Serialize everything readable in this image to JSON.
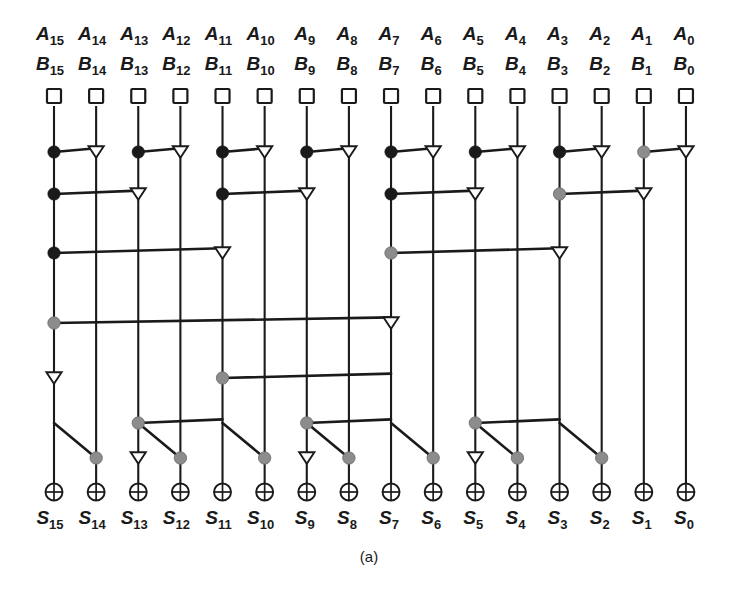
{
  "figure": {
    "caption": "(a)",
    "columns": 16,
    "bit_indices": [
      15,
      14,
      13,
      12,
      11,
      10,
      9,
      8,
      7,
      6,
      5,
      4,
      3,
      2,
      1,
      0
    ],
    "input_labels_a": [
      "A15",
      "A14",
      "A13",
      "A12",
      "A11",
      "A10",
      "A9",
      "A8",
      "A7",
      "A6",
      "A5",
      "A4",
      "A3",
      "A2",
      "A1",
      "A0"
    ],
    "input_labels_b": [
      "B15",
      "B14",
      "B13",
      "B12",
      "B11",
      "B10",
      "B9",
      "B8",
      "B7",
      "B6",
      "B5",
      "B4",
      "B3",
      "B2",
      "B1",
      "B0"
    ],
    "output_labels_s": [
      "S15",
      "S14",
      "S13",
      "S12",
      "S11",
      "S10",
      "S9",
      "S8",
      "S7",
      "S6",
      "S5",
      "S4",
      "S3",
      "S2",
      "S1",
      "S0"
    ],
    "label_letter_a": "A",
    "label_letter_b": "B",
    "label_letter_s": "S",
    "colors": {
      "line": "#1a1a1a",
      "black_cell": "#1a1a1a",
      "gray_cell": "#8c8c8c",
      "buffer_fill": "#ffffff",
      "background": "#ffffff"
    },
    "node_legend": {
      "square": "pg-generation-cell",
      "black_dot": "black-prefix-cell",
      "gray_dot": "gray-prefix-cell",
      "triangle": "buffer-cell",
      "circle_plus": "xor-sum-cell"
    }
  },
  "geometry": {
    "col_x0": 54.0,
    "col_dx": 42.13,
    "y_label_a": 40,
    "y_label_b": 70,
    "y_square": 97,
    "y_rows": [
      152,
      194,
      253,
      323,
      378,
      423,
      458
    ],
    "y_xor": 492,
    "y_label_s": 524,
    "y_caption": 562,
    "wire_top": 106,
    "wire_bottom": 483
  },
  "network": {
    "rows": [
      {
        "index": 1,
        "y": 152,
        "cells": [
          {
            "bit": 15,
            "type": "black"
          },
          {
            "bit": 14,
            "type": "buffer"
          },
          {
            "bit": 13,
            "type": "black"
          },
          {
            "bit": 12,
            "type": "buffer"
          },
          {
            "bit": 11,
            "type": "black"
          },
          {
            "bit": 10,
            "type": "buffer"
          },
          {
            "bit": 9,
            "type": "black"
          },
          {
            "bit": 8,
            "type": "buffer"
          },
          {
            "bit": 7,
            "type": "black"
          },
          {
            "bit": 6,
            "type": "buffer"
          },
          {
            "bit": 5,
            "type": "black"
          },
          {
            "bit": 4,
            "type": "buffer"
          },
          {
            "bit": 3,
            "type": "black"
          },
          {
            "bit": 2,
            "type": "buffer"
          },
          {
            "bit": 1,
            "type": "gray"
          },
          {
            "bit": 0,
            "type": "buffer"
          }
        ],
        "links": [
          {
            "from_bit": 14,
            "to_bit": 15
          },
          {
            "from_bit": 12,
            "to_bit": 13
          },
          {
            "from_bit": 10,
            "to_bit": 11
          },
          {
            "from_bit": 8,
            "to_bit": 9
          },
          {
            "from_bit": 6,
            "to_bit": 7
          },
          {
            "from_bit": 4,
            "to_bit": 5
          },
          {
            "from_bit": 2,
            "to_bit": 3
          },
          {
            "from_bit": 0,
            "to_bit": 1
          }
        ]
      },
      {
        "index": 2,
        "y": 194,
        "cells": [
          {
            "bit": 15,
            "type": "black"
          },
          {
            "bit": 13,
            "type": "buffer"
          },
          {
            "bit": 11,
            "type": "black"
          },
          {
            "bit": 9,
            "type": "buffer"
          },
          {
            "bit": 7,
            "type": "black"
          },
          {
            "bit": 5,
            "type": "buffer"
          },
          {
            "bit": 3,
            "type": "gray"
          },
          {
            "bit": 1,
            "type": "buffer"
          }
        ],
        "links": [
          {
            "from_bit": 13,
            "to_bit": 15
          },
          {
            "from_bit": 9,
            "to_bit": 11
          },
          {
            "from_bit": 5,
            "to_bit": 7
          },
          {
            "from_bit": 1,
            "to_bit": 3
          }
        ]
      },
      {
        "index": 3,
        "y": 253,
        "cells": [
          {
            "bit": 15,
            "type": "black"
          },
          {
            "bit": 11,
            "type": "buffer"
          },
          {
            "bit": 7,
            "type": "gray"
          },
          {
            "bit": 3,
            "type": "buffer"
          }
        ],
        "links": [
          {
            "from_bit": 11,
            "to_bit": 15
          },
          {
            "from_bit": 3,
            "to_bit": 7
          }
        ]
      },
      {
        "index": 4,
        "y": 323,
        "cells": [
          {
            "bit": 15,
            "type": "gray"
          },
          {
            "bit": 7,
            "type": "buffer"
          }
        ],
        "links": [
          {
            "from_bit": 7,
            "to_bit": 15
          }
        ]
      },
      {
        "index": 5,
        "y": 378,
        "cells": [
          {
            "bit": 15,
            "type": "buffer"
          },
          {
            "bit": 11,
            "type": "gray"
          }
        ],
        "links": [
          {
            "from_bit": 7,
            "to_bit": 11
          }
        ]
      },
      {
        "index": 6,
        "y": 423,
        "cells": [
          {
            "bit": 13,
            "type": "gray"
          },
          {
            "bit": 9,
            "type": "gray"
          },
          {
            "bit": 5,
            "type": "gray"
          }
        ],
        "links": [
          {
            "from_bit": 11,
            "to_bit": 13
          },
          {
            "from_bit": 7,
            "to_bit": 9
          },
          {
            "from_bit": 3,
            "to_bit": 5
          }
        ]
      },
      {
        "index": 7,
        "y": 458,
        "cells": [
          {
            "bit": 14,
            "type": "gray"
          },
          {
            "bit": 13,
            "type": "buffer"
          },
          {
            "bit": 12,
            "type": "gray"
          },
          {
            "bit": 10,
            "type": "gray"
          },
          {
            "bit": 9,
            "type": "buffer"
          },
          {
            "bit": 8,
            "type": "gray"
          },
          {
            "bit": 6,
            "type": "gray"
          },
          {
            "bit": 5,
            "type": "buffer"
          },
          {
            "bit": 4,
            "type": "gray"
          },
          {
            "bit": 2,
            "type": "gray"
          }
        ],
        "links": [
          {
            "from_bit": 15,
            "to_bit": 14,
            "dir": "left-down"
          },
          {
            "from_bit": 13,
            "to_bit": 12,
            "dir": "left-down"
          },
          {
            "from_bit": 11,
            "to_bit": 10,
            "dir": "left-down"
          },
          {
            "from_bit": 9,
            "to_bit": 8,
            "dir": "left-down"
          },
          {
            "from_bit": 7,
            "to_bit": 6,
            "dir": "left-down"
          },
          {
            "from_bit": 5,
            "to_bit": 4,
            "dir": "left-down"
          },
          {
            "from_bit": 3,
            "to_bit": 2,
            "dir": "left-down"
          }
        ]
      }
    ]
  }
}
